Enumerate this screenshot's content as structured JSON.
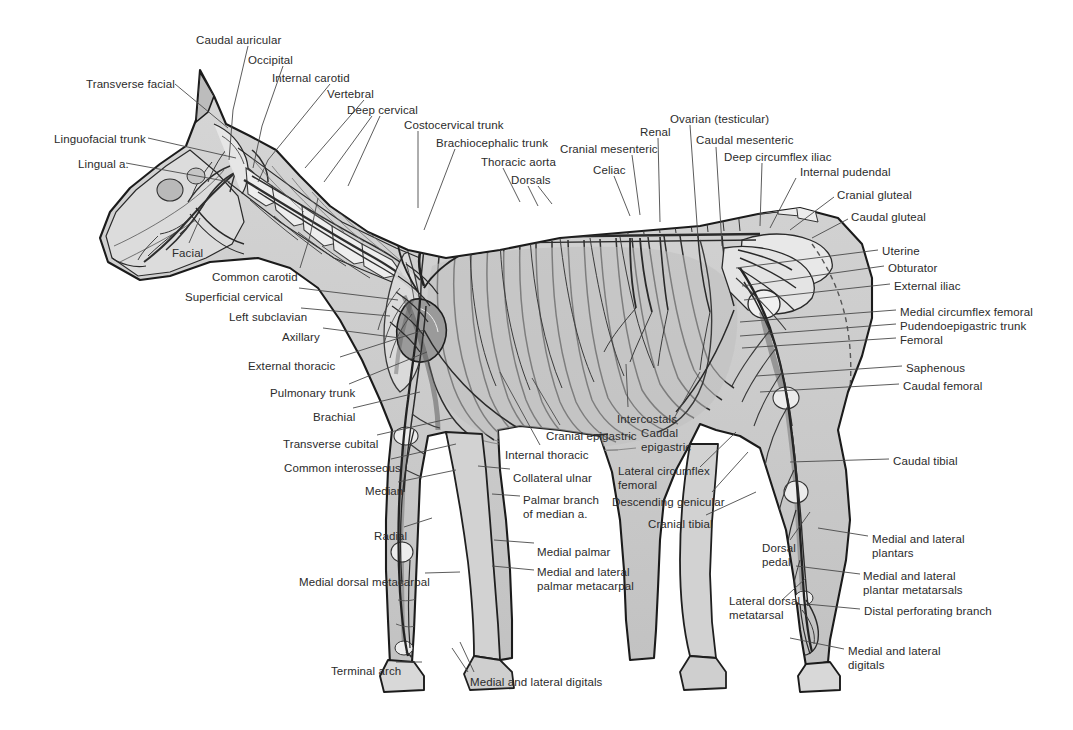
{
  "figure": {
    "background_color": "#ffffff",
    "label_color": "#2b2b2b",
    "leader_line_color": "#4a4a4a",
    "art_tones": {
      "body_fill": "#c9c9c9",
      "body_fill_light": "#dcdcdc",
      "bone_fill": "#efefef",
      "muscle_fill": "#bdbdbd",
      "outline": "#1a1a1a",
      "vessel": "#3a3a3a"
    }
  },
  "labels": [
    {
      "id": "caudal-auricular",
      "text": "Caudal auricular",
      "x": 196,
      "y": 34,
      "align": "left"
    },
    {
      "id": "occipital",
      "text": "Occipital",
      "x": 248,
      "y": 54,
      "align": "left"
    },
    {
      "id": "internal-carotid",
      "text": "Internal carotid",
      "x": 272,
      "y": 72,
      "align": "left"
    },
    {
      "id": "vertebral",
      "text": "Vertebral",
      "x": 327,
      "y": 88,
      "align": "left"
    },
    {
      "id": "deep-cervical",
      "text": "Deep cervical",
      "x": 347,
      "y": 104,
      "align": "left"
    },
    {
      "id": "costocervical-trunk",
      "text": "Costocervical trunk",
      "x": 404,
      "y": 119,
      "align": "left"
    },
    {
      "id": "brachiocephalic-trunk",
      "text": "Brachiocephalic trunk",
      "x": 436,
      "y": 137,
      "align": "left"
    },
    {
      "id": "thoracic-aorta",
      "text": "Thoracic aorta",
      "x": 481,
      "y": 156,
      "align": "left"
    },
    {
      "id": "dorsals",
      "text": "Dorsals",
      "x": 511,
      "y": 174,
      "align": "left"
    },
    {
      "id": "transverse-facial",
      "text": "Transverse facial",
      "x": 86,
      "y": 78,
      "align": "left"
    },
    {
      "id": "linguofacial-trunk",
      "text": "Linguofacial trunk",
      "x": 54,
      "y": 133,
      "align": "left"
    },
    {
      "id": "lingual-a",
      "text": "Lingual a.",
      "x": 78,
      "y": 158,
      "align": "left"
    },
    {
      "id": "facial",
      "text": "Facial",
      "x": 172,
      "y": 247,
      "align": "left"
    },
    {
      "id": "common-carotid",
      "text": "Common carotid",
      "x": 212,
      "y": 271,
      "align": "left"
    },
    {
      "id": "superficial-cervical",
      "text": "Superficial cervical",
      "x": 185,
      "y": 291,
      "align": "left"
    },
    {
      "id": "left-subclavian",
      "text": "Left subclavian",
      "x": 229,
      "y": 311,
      "align": "left"
    },
    {
      "id": "axillary",
      "text": "Axillary",
      "x": 282,
      "y": 331,
      "align": "left"
    },
    {
      "id": "external-thoracic",
      "text": "External thoracic",
      "x": 248,
      "y": 360,
      "align": "left"
    },
    {
      "id": "pulmonary-trunk",
      "text": "Pulmonary trunk",
      "x": 270,
      "y": 387,
      "align": "left"
    },
    {
      "id": "brachial",
      "text": "Brachial",
      "x": 313,
      "y": 411,
      "align": "left"
    },
    {
      "id": "transverse-cubital",
      "text": "Transverse cubital",
      "x": 283,
      "y": 438,
      "align": "left"
    },
    {
      "id": "common-interosseous",
      "text": "Common interosseous",
      "x": 284,
      "y": 462,
      "align": "left"
    },
    {
      "id": "median",
      "text": "Median",
      "x": 365,
      "y": 485,
      "align": "left"
    },
    {
      "id": "radial",
      "text": "Radial",
      "x": 374,
      "y": 530,
      "align": "left"
    },
    {
      "id": "medial-dorsal-metacarpal",
      "text": "Medial dorsal metacarpal",
      "x": 299,
      "y": 576,
      "align": "left"
    },
    {
      "id": "terminal-arch",
      "text": "Terminal arch",
      "x": 331,
      "y": 665,
      "align": "left"
    },
    {
      "id": "cranial-epigastric",
      "text": "Cranial epigastric",
      "x": 546,
      "y": 430,
      "align": "left"
    },
    {
      "id": "internal-thoracic",
      "text": "Internal thoracic",
      "x": 505,
      "y": 449,
      "align": "left"
    },
    {
      "id": "collateral-ulnar",
      "text": "Collateral ulnar",
      "x": 513,
      "y": 472,
      "align": "left"
    },
    {
      "id": "palmar-branch-of-median",
      "text": "Palmar branch\nof median a.",
      "x": 523,
      "y": 494,
      "align": "left"
    },
    {
      "id": "medial-palmar",
      "text": "Medial palmar",
      "x": 537,
      "y": 546,
      "align": "left"
    },
    {
      "id": "medial-lateral-palmar-mc",
      "text": "Medial and lateral\npalmar metacarpal",
      "x": 537,
      "y": 566,
      "align": "left"
    },
    {
      "id": "medial-lateral-digitals-fore",
      "text": "Medial and lateral digitals",
      "x": 470,
      "y": 676,
      "align": "left"
    },
    {
      "id": "intercostals",
      "text": "Intercostals",
      "x": 617,
      "y": 413,
      "align": "left"
    },
    {
      "id": "caudal-epigastric",
      "text": "Caudal\nepigastric",
      "x": 641,
      "y": 427,
      "align": "left"
    },
    {
      "id": "lateral-circumflex-femoral",
      "text": "Lateral circumflex\nfemoral",
      "x": 618,
      "y": 465,
      "align": "left"
    },
    {
      "id": "descending-genicular",
      "text": "Descending genicular",
      "x": 612,
      "y": 496,
      "align": "left"
    },
    {
      "id": "cranial-tibial",
      "text": "Cranial tibial",
      "x": 648,
      "y": 518,
      "align": "left"
    },
    {
      "id": "cranial-mesenteric",
      "text": "Cranial mesenteric",
      "x": 560,
      "y": 143,
      "align": "left"
    },
    {
      "id": "celiac",
      "text": "Celiac",
      "x": 593,
      "y": 164,
      "align": "left"
    },
    {
      "id": "renal",
      "text": "Renal",
      "x": 640,
      "y": 126,
      "align": "left"
    },
    {
      "id": "ovarian-testicular",
      "text": "Ovarian (testicular)",
      "x": 670,
      "y": 113,
      "align": "left"
    },
    {
      "id": "caudal-mesenteric",
      "text": "Caudal mesenteric",
      "x": 696,
      "y": 134,
      "align": "left"
    },
    {
      "id": "deep-circumflex-iliac",
      "text": "Deep circumflex iliac",
      "x": 724,
      "y": 151,
      "align": "left"
    },
    {
      "id": "internal-pudendal",
      "text": "Internal pudendal",
      "x": 800,
      "y": 166,
      "align": "left"
    },
    {
      "id": "cranial-gluteal",
      "text": "Cranial gluteal",
      "x": 837,
      "y": 189,
      "align": "left"
    },
    {
      "id": "caudal-gluteal",
      "text": "Caudal gluteal",
      "x": 851,
      "y": 211,
      "align": "left"
    },
    {
      "id": "uterine",
      "text": "Uterine",
      "x": 882,
      "y": 245,
      "align": "left"
    },
    {
      "id": "obturator",
      "text": "Obturator",
      "x": 888,
      "y": 262,
      "align": "left"
    },
    {
      "id": "external-iliac",
      "text": "External iliac",
      "x": 894,
      "y": 280,
      "align": "left"
    },
    {
      "id": "medial-circumflex-femoral",
      "text": "Medial circumflex femoral",
      "x": 900,
      "y": 306,
      "align": "left"
    },
    {
      "id": "pudendoepigastric-trunk",
      "text": "Pudendoepigastric trunk",
      "x": 900,
      "y": 320,
      "align": "left"
    },
    {
      "id": "femoral",
      "text": "Femoral",
      "x": 900,
      "y": 334,
      "align": "left"
    },
    {
      "id": "saphenous",
      "text": "Saphenous",
      "x": 906,
      "y": 362,
      "align": "left"
    },
    {
      "id": "caudal-femoral",
      "text": "Caudal femoral",
      "x": 903,
      "y": 380,
      "align": "left"
    },
    {
      "id": "caudal-tibial",
      "text": "Caudal tibial",
      "x": 893,
      "y": 455,
      "align": "left"
    },
    {
      "id": "medial-lateral-plantars",
      "text": "Medial and lateral\nplantars",
      "x": 872,
      "y": 533,
      "align": "left"
    },
    {
      "id": "medial-lateral-plantar-mt",
      "text": "Medial and lateral\nplantar metatarsals",
      "x": 863,
      "y": 570,
      "align": "left"
    },
    {
      "id": "distal-perforating-branch",
      "text": "Distal perforating branch",
      "x": 864,
      "y": 605,
      "align": "left"
    },
    {
      "id": "medial-lateral-digitals-hind",
      "text": "Medial and lateral\ndigitals",
      "x": 848,
      "y": 645,
      "align": "left"
    },
    {
      "id": "dorsal-pedal",
      "text": "Dorsal\npedal",
      "x": 762,
      "y": 542,
      "align": "left"
    },
    {
      "id": "lateral-dorsal-metatarsal",
      "text": "Lateral dorsal\nmetatarsal",
      "x": 729,
      "y": 595,
      "align": "left"
    }
  ],
  "leaders": [
    {
      "id": "ld-caudal-auricular",
      "pts": "248,46 233,110 229,160"
    },
    {
      "id": "ld-occipital",
      "pts": "283,66 262,126 253,168"
    },
    {
      "id": "ld-internal-carotid",
      "pts": "330,84 268,160 258,182"
    },
    {
      "id": "ld-vertebral",
      "pts": "364,100 305,168"
    },
    {
      "id": "ld-deep-cervical-a",
      "pts": "372,116 324,182"
    },
    {
      "id": "ld-deep-cervical-b",
      "pts": "380,116 348,186"
    },
    {
      "id": "ld-costocervical",
      "pts": "418,131 418,208"
    },
    {
      "id": "ld-brachiocephalic",
      "pts": "455,149 424,230"
    },
    {
      "id": "ld-thoracic-aorta",
      "pts": "503,168 520,202"
    },
    {
      "id": "ld-dorsals-a",
      "pts": "528,186 538,206"
    },
    {
      "id": "ld-dorsals-b",
      "pts": "538,186 552,204"
    },
    {
      "id": "ld-transverse-facial",
      "pts": "175,84 228,128"
    },
    {
      "id": "ld-linguofacial",
      "pts": "148,138 236,158"
    },
    {
      "id": "ld-lingual",
      "pts": "126,163 230,182"
    },
    {
      "id": "ld-facial",
      "pts": "189,243 200,218"
    },
    {
      "id": "ld-common-carotid",
      "pts": "300,268 310,236 318,198"
    },
    {
      "id": "ld-superficial-cervical",
      "pts": "299,288 398,300"
    },
    {
      "id": "ld-left-subclavian",
      "pts": "301,308 390,316"
    },
    {
      "id": "ld-axillary",
      "pts": "323,328 400,338"
    },
    {
      "id": "ld-external-thoracic",
      "pts": "340,357 424,330"
    },
    {
      "id": "ld-pulmonary-trunk",
      "pts": "349,384 427,352"
    },
    {
      "id": "ld-brachial",
      "pts": "353,408 420,392"
    },
    {
      "id": "ld-transverse-cubital",
      "pts": "377,435 452,418"
    },
    {
      "id": "ld-common-interosseous",
      "pts": "391,459 456,444"
    },
    {
      "id": "ld-median",
      "pts": "398,482 456,470"
    },
    {
      "id": "ld-radial",
      "pts": "404,527 432,518"
    },
    {
      "id": "ld-medial-dorsal-mc",
      "pts": "425,573 460,572"
    },
    {
      "id": "ld-terminal-arch",
      "pts": "396,662 422,662"
    },
    {
      "id": "ld-cranial-epigastric",
      "pts": "560,425 532,378"
    },
    {
      "id": "ld-internal-thoracic",
      "pts": "540,445 500,372"
    },
    {
      "id": "ld-collateral-ulnar",
      "pts": "510,469 478,466"
    },
    {
      "id": "ld-palmar-branch",
      "pts": "520,496 492,494"
    },
    {
      "id": "ld-medial-palmar",
      "pts": "534,543 494,540"
    },
    {
      "id": "ld-palmar-metacarpal",
      "pts": "534,570 492,566"
    },
    {
      "id": "ld-digitals-fore-a",
      "pts": "468,672 452,648"
    },
    {
      "id": "ld-digitals-fore-b",
      "pts": "474,672 460,642"
    },
    {
      "id": "ld-intercostals",
      "pts": "628,407 626,364"
    },
    {
      "id": "ld-caudal-epigastric",
      "pts": "672,422 700,372"
    },
    {
      "id": "ld-lateral-circ-fem",
      "pts": "700,467 736,432"
    },
    {
      "id": "ld-descending-genic",
      "pts": "712,492 748,452"
    },
    {
      "id": "ld-cranial-tibial",
      "pts": "706,515 756,492"
    },
    {
      "id": "ld-cranial-mesenteric",
      "pts": "632,155 640,215"
    },
    {
      "id": "ld-celiac",
      "pts": "614,176 630,216"
    },
    {
      "id": "ld-renal",
      "pts": "658,138 660,222"
    },
    {
      "id": "ld-ovarian",
      "pts": "690,125 698,238"
    },
    {
      "id": "ld-caudal-mesenteric",
      "pts": "716,147 722,246"
    },
    {
      "id": "ld-deep-circ-iliac",
      "pts": "762,163 760,226"
    },
    {
      "id": "ld-internal-pudendal",
      "pts": "796,178 770,228"
    },
    {
      "id": "ld-cranial-gluteal",
      "pts": "834,197 790,230"
    },
    {
      "id": "ld-caudal-gluteal",
      "pts": "848,219 812,238"
    },
    {
      "id": "ld-uterine",
      "pts": "878,250 736,268"
    },
    {
      "id": "ld-obturator",
      "pts": "884,266 742,286"
    },
    {
      "id": "ld-external-iliac",
      "pts": "890,284 744,300"
    },
    {
      "id": "ld-medial-circ-fem",
      "pts": "896,310 740,322"
    },
    {
      "id": "ld-pudendoepigastric",
      "pts": "896,324 740,336"
    },
    {
      "id": "ld-femoral",
      "pts": "896,338 742,348"
    },
    {
      "id": "ld-saphenous",
      "pts": "902,366 756,376"
    },
    {
      "id": "ld-caudal-femoral",
      "pts": "899,384 760,392"
    },
    {
      "id": "ld-caudal-tibial",
      "pts": "889,459 790,462"
    },
    {
      "id": "ld-plantars",
      "pts": "868,536 818,528"
    },
    {
      "id": "ld-plantar-metatarsals",
      "pts": "860,574 796,566"
    },
    {
      "id": "ld-distal-perforating",
      "pts": "860,609 806,604"
    },
    {
      "id": "ld-digitals-hind",
      "pts": "844,649 790,638"
    },
    {
      "id": "ld-dorsal-pedal",
      "pts": "790,540 810,512"
    },
    {
      "id": "ld-lat-dorsal-mt",
      "pts": "782,600 806,578"
    }
  ]
}
